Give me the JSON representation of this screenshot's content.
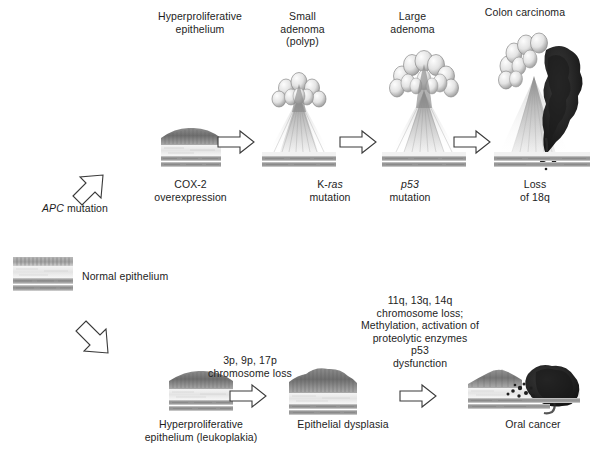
{
  "figure": {
    "colors": {
      "background": "#ffffff",
      "text": "#1d1d1d",
      "arrow_outline": "#3a3a3a",
      "epithelium_dark": "#6f6f6f",
      "epithelium_mid": "#9b9b9b",
      "stroma_light": "#e6e6e6",
      "muscle_band": "#8a8a8a",
      "tumor_dark": "#262626"
    }
  },
  "pathways": [
    {
      "id": "colon",
      "name": "Colon carcinoma pathway",
      "stages": [
        {
          "id": "hyperproliferative-epithelium",
          "label": "Hyperproliferative\nepithelium",
          "label_position": "above",
          "image": "flat-epithelium-thickened"
        },
        {
          "id": "small-adenoma",
          "label": "Small\nadenoma\n(polyp)",
          "label_position": "above",
          "image": "small-polyp"
        },
        {
          "id": "large-adenoma",
          "label": "Large\nadenoma",
          "label_position": "above",
          "image": "large-polyp"
        },
        {
          "id": "colon-carcinoma",
          "label": "Colon carcinoma",
          "label_position": "above",
          "image": "carcinoma-invasive-mass"
        }
      ],
      "transitions": [
        {
          "id": "apc",
          "label": "APC mutation",
          "italic_part": "APC",
          "arrow": "diagonal-up-right"
        },
        {
          "id": "cox2",
          "label": "COX-2\noverexpression",
          "arrow": "none"
        },
        {
          "id": "kras",
          "label": "K-ras\nmutation",
          "italic_part": "ras",
          "arrow": "right"
        },
        {
          "id": "p53",
          "label": "p53\nmutation",
          "italic_part": "p53",
          "arrow": "right"
        },
        {
          "id": "loss18q",
          "label": "Loss\nof 18q",
          "arrow": "right"
        }
      ]
    },
    {
      "id": "oral",
      "name": "Oral cancer pathway",
      "stages": [
        {
          "id": "normal-epithelium",
          "label": "Normal epithelium",
          "label_position": "right",
          "image": "flat-epithelium-normal"
        },
        {
          "id": "hyperproliferative-leukoplakia",
          "label": "Hyperproliferative\nepithelium (leukoplakia)",
          "label_position": "below",
          "image": "flat-epithelium-thickened"
        },
        {
          "id": "epithelial-dysplasia",
          "label": "Epithelial dysplasia",
          "label_position": "below",
          "image": "dysplastic-epithelium"
        },
        {
          "id": "oral-cancer",
          "label": "Oral cancer",
          "label_position": "below",
          "image": "oral-invasive-tumor"
        }
      ],
      "transitions": [
        {
          "id": "normal-to-hyper",
          "label": "",
          "arrow": "diagonal-down-right"
        },
        {
          "id": "chromosome-loss-3p9p17p",
          "label": "3p, 9p, 17p\nchromosome loss",
          "arrow": "right"
        },
        {
          "id": "late-events",
          "label": "11q, 13q, 14q\nchromosome loss;\nMethylation, activation of\nproteolytic enzymes\np53\ndysfunction",
          "arrow": "right"
        }
      ]
    }
  ]
}
